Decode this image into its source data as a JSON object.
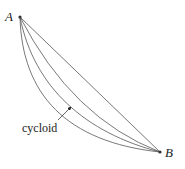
{
  "diagram": {
    "points": {
      "A": {
        "label": "A",
        "x": 20,
        "y": 17
      },
      "B": {
        "label": "B",
        "x": 160,
        "y": 152
      }
    },
    "curves": [
      {
        "name": "straight-line",
        "path": "M20,17 L160,152"
      },
      {
        "name": "curve-shallow",
        "path": "M20,17 Q72,118 160,152"
      },
      {
        "name": "cycloid",
        "path": "M20,17 C34,88 86,133 160,152"
      },
      {
        "name": "curve-deep",
        "path": "M20,17 C22,94 66,142 160,152"
      }
    ],
    "annotation": {
      "label": "cycloid",
      "label_x": 20,
      "label_y": 129,
      "arrow_from": {
        "x": 58,
        "y": 120
      },
      "arrow_to": {
        "x": 71,
        "y": 107
      }
    },
    "colors": {
      "curve": "#555555",
      "line": "#555555",
      "text": "#222222"
    }
  }
}
